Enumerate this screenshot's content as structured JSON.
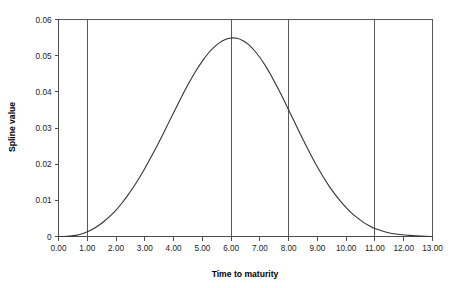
{
  "chart_data": {
    "type": "line",
    "title": "",
    "xlabel": "Time to maturity",
    "ylabel": "Spline value",
    "xlim": [
      0.0,
      13.0
    ],
    "ylim": [
      0.0,
      0.06
    ],
    "grid": "vertical-only",
    "legend": "none",
    "x_tick_labels": [
      "0.00",
      "1.00",
      "2.00",
      "3.00",
      "4.00",
      "5.00",
      "6.00",
      "7.00",
      "8.00",
      "9.00",
      "10.00",
      "11.00",
      "12.00",
      "13.00"
    ],
    "x_tick_values": [
      0,
      1,
      2,
      3,
      4,
      5,
      6,
      7,
      8,
      9,
      10,
      11,
      12,
      13
    ],
    "y_tick_labels": [
      "0",
      "0.01",
      "0.02",
      "0.03",
      "0.04",
      "0.05",
      "0.06"
    ],
    "y_tick_values": [
      0,
      0.01,
      0.02,
      0.03,
      0.04,
      0.05,
      0.06
    ],
    "vertical_reference_lines": [
      1.0,
      6.0,
      8.0,
      11.0
    ],
    "series": [
      {
        "name": "Spline value",
        "color": "#333333",
        "x": [
          0.0,
          0.2,
          0.4,
          0.6,
          0.8,
          1.0,
          1.2,
          1.4,
          1.6,
          1.8,
          2.0,
          2.2,
          2.4,
          2.6,
          2.8,
          3.0,
          3.2,
          3.4,
          3.6,
          3.8,
          4.0,
          4.2,
          4.4,
          4.6,
          4.8,
          5.0,
          5.2,
          5.4,
          5.6,
          5.8,
          6.0,
          6.2,
          6.4,
          6.6,
          6.8,
          7.0,
          7.2,
          7.4,
          7.6,
          7.8,
          8.0,
          8.2,
          8.4,
          8.6,
          8.8,
          9.0,
          9.2,
          9.4,
          9.6,
          9.8,
          10.0,
          10.2,
          10.4,
          10.6,
          10.8,
          11.0,
          11.4,
          11.8,
          12.2,
          12.6,
          13.0
        ],
        "y": [
          0.0,
          0.0,
          0.0001,
          0.0003,
          0.0007,
          0.0013,
          0.0021,
          0.0031,
          0.0043,
          0.0057,
          0.0073,
          0.0092,
          0.0113,
          0.0136,
          0.0161,
          0.0188,
          0.0217,
          0.0247,
          0.0278,
          0.031,
          0.0342,
          0.0374,
          0.0405,
          0.0434,
          0.0461,
          0.0485,
          0.0506,
          0.0523,
          0.0536,
          0.0545,
          0.0549,
          0.0548,
          0.0542,
          0.0531,
          0.0515,
          0.0495,
          0.0471,
          0.0444,
          0.0414,
          0.0383,
          0.035,
          0.0317,
          0.0284,
          0.0252,
          0.0221,
          0.0192,
          0.0165,
          0.014,
          0.0118,
          0.0098,
          0.008,
          0.0064,
          0.0051,
          0.0039,
          0.003,
          0.0022,
          0.0012,
          0.0006,
          0.0003,
          0.0001,
          0.0
        ]
      }
    ],
    "peak": {
      "x": 5.45,
      "y": 0.0549
    }
  },
  "axes": {
    "x_title": "Time to maturity",
    "y_title": "Spline value"
  }
}
